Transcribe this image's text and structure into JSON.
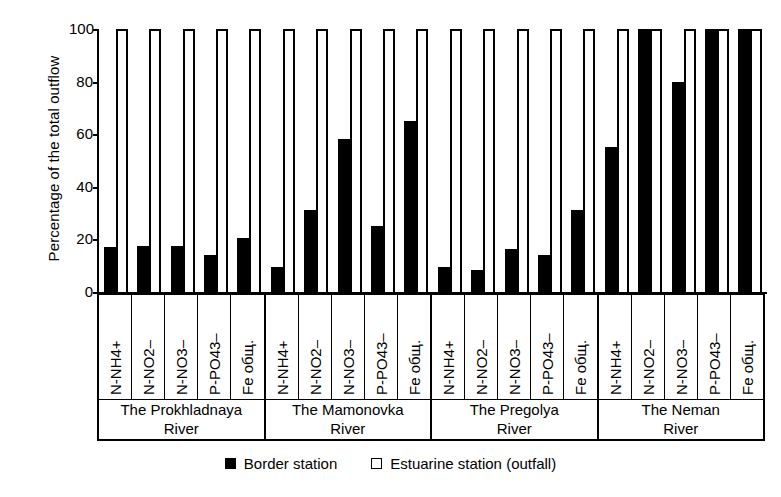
{
  "chart_data": {
    "type": "bar",
    "title": "",
    "xlabel": "",
    "ylabel": "Percentage of the total outflow",
    "ylim": [
      0,
      100
    ],
    "yticks": [
      0,
      20,
      40,
      60,
      80,
      100
    ],
    "grid": false,
    "legend_position": "bottom",
    "categories": [
      "N-NH4+",
      "N-NO2–",
      "N-NO3–",
      "P-PO43–",
      "Fe общ.",
      "N-NH4+",
      "N-NO2–",
      "N-NO3–",
      "P-PO43–",
      "Fe общ.",
      "N-NH4+",
      "N-NO2–",
      "N-NO3–",
      "P-PO43–",
      "Fe общ.",
      "N-NH4+",
      "N-NO2–",
      "N-NO3–",
      "P-PO43–",
      "Fe общ."
    ],
    "series": [
      {
        "name": "Border station",
        "color": "#000000",
        "values": [
          17,
          17.5,
          17.5,
          14,
          20.5,
          9.5,
          31,
          58,
          25,
          65,
          9.5,
          8.5,
          16.5,
          14,
          31,
          55,
          100,
          80,
          100,
          100
        ]
      },
      {
        "name": "Estuarine station (outfall)",
        "color": "#ffffff",
        "values": [
          100,
          100,
          100,
          100,
          100,
          100,
          100,
          100,
          100,
          100,
          100,
          100,
          100,
          100,
          100,
          100,
          100,
          100,
          100,
          100
        ]
      }
    ],
    "groups": [
      {
        "name": "The Prokhladnaya River",
        "line1": "The Prokhladnaya",
        "line2": "River",
        "items": [
          {
            "label": "N-NH4+",
            "border": 17,
            "estuarine": 100
          },
          {
            "label": "N-NO2–",
            "border": 17.5,
            "estuarine": 100
          },
          {
            "label": "N-NO3–",
            "border": 17.5,
            "estuarine": 100
          },
          {
            "label": "P-PO43–",
            "border": 14,
            "estuarine": 100
          },
          {
            "label": "Fe общ.",
            "border": 20.5,
            "estuarine": 100
          }
        ]
      },
      {
        "name": "The Mamonovka River",
        "line1": "The Mamonovka",
        "line2": "River",
        "items": [
          {
            "label": "N-NH4+",
            "border": 9.5,
            "estuarine": 100
          },
          {
            "label": "N-NO2–",
            "border": 31,
            "estuarine": 100
          },
          {
            "label": "N-NO3–",
            "border": 58,
            "estuarine": 100
          },
          {
            "label": "P-PO43–",
            "border": 25,
            "estuarine": 100
          },
          {
            "label": "Fe общ.",
            "border": 65,
            "estuarine": 100
          }
        ]
      },
      {
        "name": "The Pregolya River",
        "line1": "The Pregolya",
        "line2": "River",
        "items": [
          {
            "label": "N-NH4+",
            "border": 9.5,
            "estuarine": 100
          },
          {
            "label": "N-NO2–",
            "border": 8.5,
            "estuarine": 100
          },
          {
            "label": "N-NO3–",
            "border": 16.5,
            "estuarine": 100
          },
          {
            "label": "P-PO43–",
            "border": 14,
            "estuarine": 100
          },
          {
            "label": "Fe общ.",
            "border": 31,
            "estuarine": 100
          }
        ]
      },
      {
        "name": "The Neman River",
        "line1": "The Neman",
        "line2": "River",
        "items": [
          {
            "label": "N-NH4+",
            "border": 55,
            "estuarine": 100
          },
          {
            "label": "N-NO2–",
            "border": 100,
            "estuarine": 100
          },
          {
            "label": "N-NO3–",
            "border": 80,
            "estuarine": 100
          },
          {
            "label": "P-PO43–",
            "border": 100,
            "estuarine": 100
          },
          {
            "label": "Fe общ.",
            "border": 100,
            "estuarine": 100
          }
        ]
      }
    ],
    "legend": [
      {
        "marker": "filled",
        "label": "Border station"
      },
      {
        "marker": "hollow",
        "label": "Estuarine station (outfall)"
      }
    ]
  }
}
